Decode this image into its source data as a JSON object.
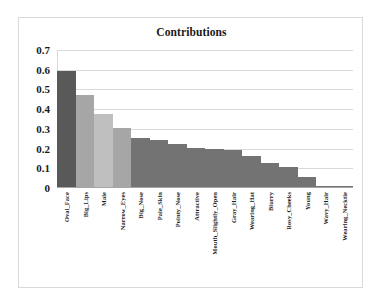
{
  "chart_data": {
    "type": "bar",
    "title": "Contributions",
    "xlabel": "",
    "ylabel": "",
    "ylim": [
      0,
      0.7
    ],
    "ytick_labels": [
      "0.7",
      "0.6",
      "0.5",
      "0.4",
      "0.3",
      "0.2",
      "0.1",
      "0"
    ],
    "ytick_values": [
      0.7,
      0.6,
      0.5,
      0.4,
      0.3,
      0.2,
      0.1,
      0
    ],
    "grid": true,
    "legend": null,
    "orientation": "vertical",
    "categories": [
      "Oval_Face",
      "Big_Lips",
      "Male",
      "Narrow_Eyes",
      "Big_Nose",
      "Pale_Skin",
      "Pointy_Nose",
      "Attractive",
      "Mouth_Slightly_Open",
      "Gray_Hair",
      "Wearing_Hat",
      "Blurry",
      "Rosy_Cheeks",
      "Young",
      "Wavy_Hair",
      "Wearing_Necktie"
    ],
    "values": [
      0.595,
      0.47,
      0.375,
      0.305,
      0.255,
      0.245,
      0.225,
      0.205,
      0.2,
      0.195,
      0.16,
      0.125,
      0.105,
      0.055,
      0.01,
      0.008
    ],
    "bar_colors": [
      "#595959",
      "#a6a6a6",
      "#bfbfbf",
      "#a6a6a6",
      "#737373",
      "#737373",
      "#737373",
      "#737373",
      "#737373",
      "#737373",
      "#737373",
      "#737373",
      "#737373",
      "#737373",
      "#737373",
      "#737373"
    ]
  },
  "colors": {
    "frame_border": "#d9d9d9",
    "gridline": "#d9d9d9",
    "axis": "#a6a6a6",
    "text": "#1a1a1a",
    "background": "#ffffff"
  }
}
